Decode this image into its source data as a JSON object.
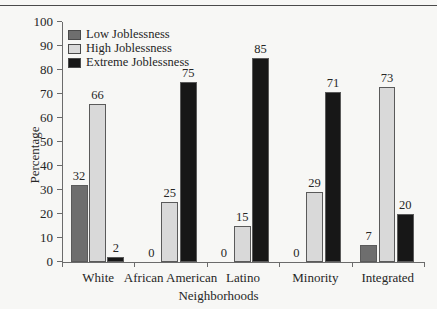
{
  "figure": {
    "caption_remnant": "",
    "background_color": "#f7f7f5"
  },
  "legend": {
    "position": "top-left-inside",
    "items": [
      {
        "label": "Low Joblessness",
        "color": "#6e6e6e"
      },
      {
        "label": "High Joblessness",
        "color": "#d9d9d9"
      },
      {
        "label": "Extreme Joblessness",
        "color": "#171717"
      }
    ]
  },
  "axes": {
    "ylabel": "Percentage",
    "xlabel": "Neighborhoods",
    "yticks": [
      0,
      10,
      20,
      30,
      40,
      50,
      60,
      70,
      80,
      90,
      100
    ],
    "ytick_labels": [
      "0",
      "10",
      "20",
      "30",
      "40",
      "50",
      "60",
      "70",
      "80",
      "90",
      "100"
    ],
    "ylim": [
      0,
      100
    ],
    "grid": false
  },
  "chart_data": {
    "type": "bar",
    "title": "",
    "subtitle": "",
    "xlabel": "Neighborhoods",
    "ylabel": "Percentage",
    "ylim": [
      0,
      100
    ],
    "grid": false,
    "legend_position": "upper left",
    "categories": [
      "White",
      "African American",
      "Latino",
      "Minority",
      "Integrated"
    ],
    "series": [
      {
        "name": "Low Joblessness",
        "color": "#6e6e6e",
        "values": [
          32,
          0,
          0,
          0,
          7
        ],
        "labels": [
          "32",
          "0",
          "0",
          "0",
          "7"
        ]
      },
      {
        "name": "High Joblessness",
        "color": "#d9d9d9",
        "values": [
          66,
          25,
          15,
          29,
          73
        ],
        "labels": [
          "66",
          "25",
          "15",
          "29",
          "73"
        ]
      },
      {
        "name": "Extreme Joblessness",
        "color": "#171717",
        "values": [
          2,
          75,
          85,
          71,
          20
        ],
        "labels": [
          "2",
          "75",
          "85",
          "71",
          "20"
        ]
      }
    ]
  }
}
